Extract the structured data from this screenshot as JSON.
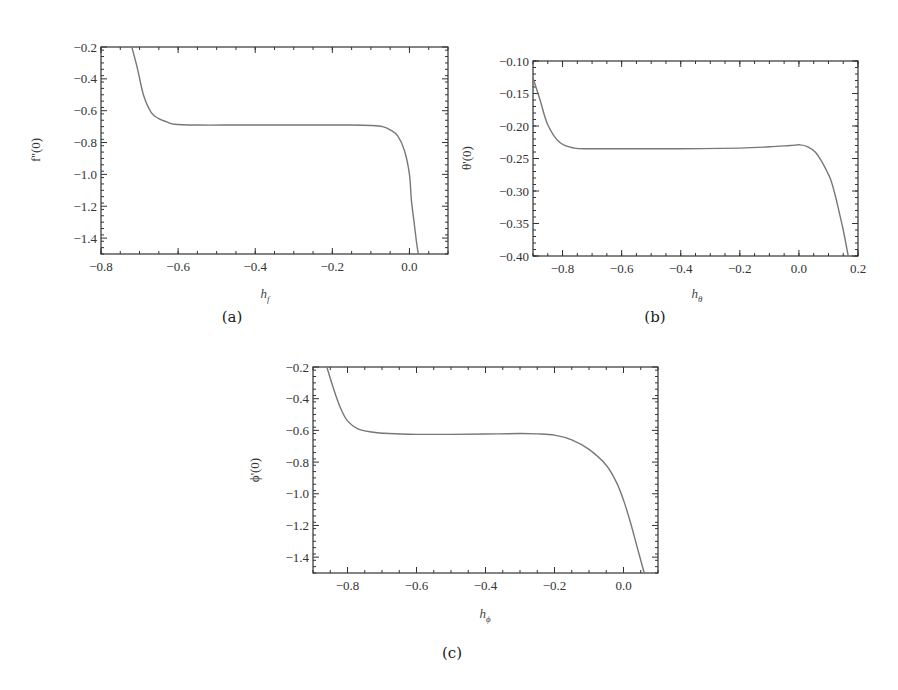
{
  "chart_data": [
    {
      "type": "line",
      "panel": "(a)",
      "title": "",
      "xlabel": "h_f",
      "xlabel_main": "h",
      "xlabel_sub": "f",
      "ylabel": "f''(0)",
      "xlim": [
        -0.8,
        0.1
      ],
      "ylim": [
        -1.5,
        -0.2
      ],
      "xticks": [
        -0.8,
        -0.6,
        -0.4,
        -0.2,
        0.0
      ],
      "xtick_labels": [
        "−0.8",
        "−0.6",
        "−0.4",
        "−0.2",
        "0.0"
      ],
      "yticks": [
        -0.2,
        -0.4,
        -0.6,
        -0.8,
        -1.0,
        -1.2,
        -1.4
      ],
      "ytick_labels": [
        "−0.2",
        "−0.4",
        "−0.6",
        "−0.8",
        "−1.0",
        "−1.2",
        "−1.4"
      ],
      "grid": false,
      "legend": "none",
      "series": [
        {
          "name": "f''(0)",
          "color": "#777777",
          "x": [
            -0.72,
            -0.705,
            -0.69,
            -0.67,
            -0.65,
            -0.63,
            -0.61,
            -0.55,
            -0.45,
            -0.35,
            -0.25,
            -0.15,
            -0.1,
            -0.07,
            -0.05,
            -0.03,
            -0.013,
            0.0,
            0.005,
            0.012,
            0.018,
            0.023
          ],
          "y": [
            -0.2,
            -0.34,
            -0.5,
            -0.61,
            -0.65,
            -0.67,
            -0.685,
            -0.69,
            -0.69,
            -0.69,
            -0.69,
            -0.69,
            -0.693,
            -0.7,
            -0.72,
            -0.76,
            -0.85,
            -1.0,
            -1.16,
            -1.3,
            -1.42,
            -1.5
          ]
        }
      ]
    },
    {
      "type": "line",
      "panel": "(b)",
      "title": "",
      "xlabel": "h_θ",
      "xlabel_main": "h",
      "xlabel_sub": "θ",
      "ylabel": "θ'(0)",
      "xlim": [
        -0.9,
        0.2
      ],
      "ylim": [
        -0.4,
        -0.1
      ],
      "xticks": [
        -0.8,
        -0.6,
        -0.4,
        -0.2,
        0.0,
        0.2
      ],
      "xtick_labels": [
        "−0.8",
        "−0.6",
        "−0.4",
        "−0.2",
        "0.0",
        "0.2"
      ],
      "yticks": [
        -0.1,
        -0.15,
        -0.2,
        -0.25,
        -0.3,
        -0.35,
        -0.4
      ],
      "ytick_labels": [
        "−0.10",
        "−0.15",
        "−0.20",
        "−0.25",
        "−0.30",
        "−0.35",
        "−0.40"
      ],
      "grid": false,
      "legend": "none",
      "series": [
        {
          "name": "θ'(0)",
          "color": "#777777",
          "x": [
            -0.9,
            -0.876,
            -0.85,
            -0.81,
            -0.76,
            -0.7,
            -0.6,
            -0.4,
            -0.2,
            -0.1,
            -0.03,
            0.004,
            0.03,
            0.055,
            0.075,
            0.095,
            0.108,
            0.122,
            0.135,
            0.15,
            0.167
          ],
          "y": [
            -0.126,
            -0.16,
            -0.198,
            -0.225,
            -0.234,
            -0.235,
            -0.235,
            -0.235,
            -0.234,
            -0.232,
            -0.23,
            -0.229,
            -0.232,
            -0.24,
            -0.253,
            -0.27,
            -0.283,
            -0.305,
            -0.33,
            -0.36,
            -0.4
          ]
        }
      ]
    },
    {
      "type": "line",
      "panel": "(c)",
      "title": "",
      "xlabel": "h_ϕ",
      "xlabel_main": "h",
      "xlabel_sub": "ϕ",
      "ylabel": "ϕ'(0)",
      "xlim": [
        -0.9,
        0.1
      ],
      "ylim": [
        -1.5,
        -0.2
      ],
      "xticks": [
        -0.8,
        -0.6,
        -0.4,
        -0.2,
        0.0
      ],
      "xtick_labels": [
        "−0.8",
        "−0.6",
        "−0.4",
        "−0.2",
        "0.0"
      ],
      "yticks": [
        -0.2,
        -0.4,
        -0.6,
        -0.8,
        -1.0,
        -1.2,
        -1.4
      ],
      "ytick_labels": [
        "−0.2",
        "−0.4",
        "−0.6",
        "−0.8",
        "−1.0",
        "−1.2",
        "−1.4"
      ],
      "grid": false,
      "legend": "none",
      "series": [
        {
          "name": "ϕ'(0)",
          "color": "#777777",
          "x": [
            -0.86,
            -0.84,
            -0.82,
            -0.8,
            -0.77,
            -0.73,
            -0.68,
            -0.6,
            -0.5,
            -0.4,
            -0.3,
            -0.25,
            -0.2,
            -0.15,
            -0.1,
            -0.05,
            -0.02,
            0.0,
            0.02,
            0.04,
            0.06
          ],
          "y": [
            -0.2,
            -0.34,
            -0.46,
            -0.54,
            -0.59,
            -0.61,
            -0.62,
            -0.625,
            -0.625,
            -0.623,
            -0.62,
            -0.622,
            -0.63,
            -0.66,
            -0.72,
            -0.82,
            -0.93,
            -1.04,
            -1.18,
            -1.34,
            -1.5
          ]
        }
      ]
    }
  ]
}
